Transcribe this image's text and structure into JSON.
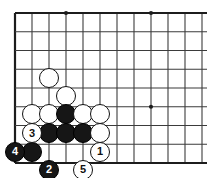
{
  "diagram": {
    "type": "go-board-problem",
    "board": {
      "grid_cols": 12,
      "grid_rows": 9,
      "origin_x": 15,
      "origin_y": 13,
      "col_step": 17,
      "row_step": 18.75,
      "line_color": "#3b3b3b",
      "edge_color": "#1c1c1c",
      "background_color": "#ffffff",
      "stone_radius": 10,
      "star_points": [
        {
          "col": 3,
          "row": 0
        },
        {
          "col": 8,
          "row": 0
        },
        {
          "col": 8,
          "row": 5
        }
      ],
      "edges": {
        "left": true,
        "top": true,
        "bottom": true,
        "right": false
      }
    },
    "stones": [
      {
        "id": "w-a",
        "color": "white",
        "col": 2,
        "row": 3.45,
        "label": ""
      },
      {
        "id": "w-b",
        "color": "white",
        "col": 3,
        "row": 4.45,
        "label": ""
      },
      {
        "id": "w-c",
        "color": "white",
        "col": 1,
        "row": 5.4,
        "label": ""
      },
      {
        "id": "w-d",
        "color": "white",
        "col": 2,
        "row": 5.4,
        "label": ""
      },
      {
        "id": "b-a",
        "color": "black",
        "col": 3,
        "row": 5.4,
        "label": ""
      },
      {
        "id": "w-e",
        "color": "white",
        "col": 4,
        "row": 5.4,
        "label": ""
      },
      {
        "id": "w-f",
        "color": "white",
        "col": 5,
        "row": 5.4,
        "label": ""
      },
      {
        "id": "w-3",
        "color": "white",
        "col": 1,
        "row": 6.4,
        "label": "3"
      },
      {
        "id": "b-b",
        "color": "black",
        "col": 2,
        "row": 6.4,
        "label": ""
      },
      {
        "id": "b-c",
        "color": "black",
        "col": 3,
        "row": 6.4,
        "label": ""
      },
      {
        "id": "b-d",
        "color": "black",
        "col": 4,
        "row": 6.4,
        "label": ""
      },
      {
        "id": "w-g",
        "color": "white",
        "col": 5,
        "row": 6.4,
        "label": ""
      },
      {
        "id": "b-4",
        "color": "black",
        "col": 0,
        "row": 7.4,
        "label": "4"
      },
      {
        "id": "b-e",
        "color": "black",
        "col": 1,
        "row": 7.4,
        "label": ""
      },
      {
        "id": "w-1",
        "color": "white",
        "col": 5,
        "row": 7.4,
        "label": "1"
      },
      {
        "id": "b-2",
        "color": "black",
        "col": 2,
        "row": 8.35,
        "label": "2"
      },
      {
        "id": "w-5",
        "color": "white",
        "col": 4,
        "row": 8.35,
        "label": "5"
      }
    ],
    "move_labels": [
      "1",
      "2",
      "3",
      "4",
      "5"
    ],
    "colors": {
      "black_stone": "#161616",
      "white_stone": "#ffffff",
      "stone_outline": "#111111",
      "grid": "#3b3b3b"
    }
  }
}
